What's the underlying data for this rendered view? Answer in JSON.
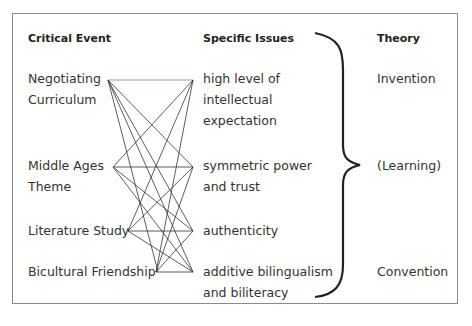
{
  "headers": {
    "critical_event": "Critical Event",
    "specific_issues": "Specific Issues",
    "theory": "Theory"
  },
  "critical_events": [
    {
      "line1": "Negotiating",
      "line2": "Curriculum"
    },
    {
      "line1": "Middle Ages",
      "line2": "Theme"
    },
    {
      "line1": "Literature Study",
      "line2": ""
    },
    {
      "line1": "Bicultural Friendship",
      "line2": ""
    }
  ],
  "specific_issues": [
    {
      "line1": "high level of",
      "line2": "intellectual",
      "line3": "expectation"
    },
    {
      "line1": "symmetric power",
      "line2": "and trust",
      "line3": ""
    },
    {
      "line1": "authenticity",
      "line2": "",
      "line3": ""
    },
    {
      "line1": "additive bilingualism",
      "line2": "and biliteracy",
      "line3": ""
    }
  ],
  "theories": [
    {
      "label": "Invention"
    },
    {
      "label": "(Learning)"
    },
    {
      "label": "Convention"
    }
  ],
  "connections": "each critical event connected to every specific issue",
  "colors": {
    "line": "#333333",
    "top_line": "#6a9a5a",
    "frame": "#8a8a8a"
  }
}
